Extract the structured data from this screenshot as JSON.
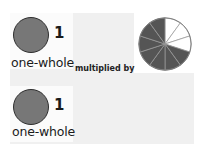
{
  "operand_a": {
    "number": "1",
    "label": "one-whole",
    "fill": "#777777"
  },
  "operator": "multiplied by",
  "operand_b": {
    "type": "fraction-pie",
    "total_slices": 10,
    "shaded_slices": 7,
    "shaded_color": "#555555",
    "unshaded_color": "#ffffff"
  },
  "result": {
    "number": "1",
    "label": "one-whole",
    "fill": "#777777"
  }
}
